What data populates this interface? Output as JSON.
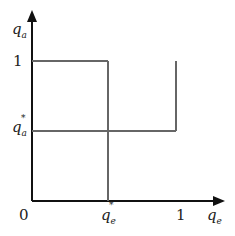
{
  "diagram": {
    "y_axis": {
      "label": "q",
      "subscript": "a"
    },
    "x_axis": {
      "label": "q",
      "subscript": "e"
    },
    "y_ticks": [
      {
        "label": "1"
      },
      {
        "label": "q",
        "subscript": "a",
        "superscript": "*"
      }
    ],
    "x_ticks": [
      {
        "label": "0"
      },
      {
        "label": "q",
        "subscript": "e",
        "superscript": "*"
      },
      {
        "label": "1"
      }
    ],
    "line_color": "#666666",
    "axis_color": "#111111"
  }
}
